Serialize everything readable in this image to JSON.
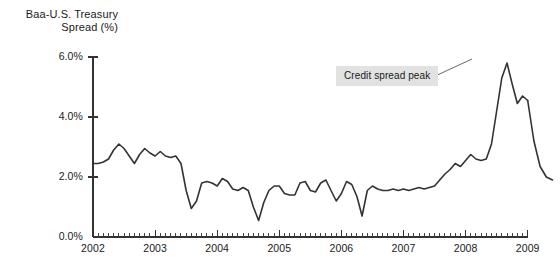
{
  "figure": {
    "title_line1": "Baa-U.S. Treasury",
    "title_line2": "Spread (%)",
    "line_color": "#333333",
    "axis_color": "#333333",
    "annotation_bg": "#e2e2e2"
  },
  "annotation": {
    "label": "Credit spread peak",
    "box_x": 336,
    "box_y": 66,
    "leader_from_x": 433,
    "leader_from_y": 77,
    "leader_to_x": 472,
    "leader_to_y": 59
  },
  "chart_data": {
    "type": "line",
    "xlabel": "",
    "ylabel": "Baa-U.S. Treasury Spread (%)",
    "xlim": [
      2002.0,
      2009.0
    ],
    "ylim": [
      0.0,
      6.0
    ],
    "grid": false,
    "legend": "none",
    "y_ticks": [
      0.0,
      2.0,
      4.0,
      6.0
    ],
    "y_tick_labels": [
      "0.0%",
      "2.0%",
      "4.0%",
      "6.0%"
    ],
    "x_ticks": [
      2002,
      2003,
      2004,
      2005,
      2006,
      2007,
      2008,
      2009
    ],
    "x_tick_labels": [
      "2002",
      "2003",
      "2004",
      "2005",
      "2006",
      "2007",
      "2008",
      "2009"
    ],
    "x_minor_tick_interval": 0.0833,
    "series": [
      {
        "name": "Baa-U.S. Treasury Spread",
        "x": [
          2002.0,
          2002.083,
          2002.167,
          2002.25,
          2002.333,
          2002.417,
          2002.5,
          2002.583,
          2002.667,
          2002.75,
          2002.833,
          2002.917,
          2003.0,
          2003.083,
          2003.167,
          2003.25,
          2003.333,
          2003.417,
          2003.5,
          2003.583,
          2003.667,
          2003.75,
          2003.833,
          2003.917,
          2004.0,
          2004.083,
          2004.167,
          2004.25,
          2004.333,
          2004.417,
          2004.5,
          2004.583,
          2004.667,
          2004.75,
          2004.833,
          2004.917,
          2005.0,
          2005.083,
          2005.167,
          2005.25,
          2005.333,
          2005.417,
          2005.5,
          2005.583,
          2005.667,
          2005.75,
          2005.833,
          2005.917,
          2006.0,
          2006.083,
          2006.167,
          2006.25,
          2006.333,
          2006.417,
          2006.5,
          2006.583,
          2006.667,
          2006.75,
          2006.833,
          2006.917,
          2007.0,
          2007.083,
          2007.167,
          2007.25,
          2007.333,
          2007.417,
          2007.5,
          2007.583,
          2007.667,
          2007.75,
          2007.833,
          2007.917,
          2008.0,
          2008.083,
          2008.167,
          2008.25,
          2008.333,
          2008.417,
          2008.5,
          2008.583,
          2008.667,
          2008.75,
          2008.833,
          2008.917,
          2009.0
        ],
        "y": [
          2.45,
          2.45,
          2.5,
          2.6,
          2.9,
          3.1,
          2.95,
          2.7,
          2.45,
          2.75,
          2.95,
          2.8,
          2.7,
          2.85,
          2.7,
          2.65,
          2.7,
          2.45,
          1.55,
          0.95,
          1.2,
          1.8,
          1.85,
          1.8,
          1.7,
          1.95,
          1.85,
          1.6,
          1.55,
          1.65,
          1.55,
          1.0,
          0.55,
          1.15,
          1.55,
          1.7,
          1.7,
          1.45,
          1.4,
          1.4,
          1.8,
          1.85,
          1.55,
          1.5,
          1.8,
          1.9,
          1.55,
          1.2,
          1.45,
          1.85,
          1.75,
          1.35,
          0.7,
          1.55,
          1.7,
          1.6,
          1.55,
          1.55,
          1.6,
          1.55,
          1.6,
          1.55,
          1.6,
          1.65,
          1.6,
          1.65,
          1.7,
          1.9,
          2.1,
          2.25,
          2.45,
          2.35,
          2.55,
          2.75,
          2.6,
          2.55,
          2.6,
          3.1,
          4.2,
          5.3,
          5.8,
          5.1,
          4.45,
          4.7,
          4.55
        ]
      },
      {
        "name": "tail_segment",
        "x": [
          2009.0,
          2009.1,
          2009.2,
          2009.3,
          2009.4
        ],
        "y": [
          4.55,
          3.2,
          2.35,
          2.0,
          1.9
        ]
      }
    ],
    "annotations": [
      {
        "text": "Credit spread peak",
        "points_to_x": 2008.6,
        "points_to_y": 5.9
      }
    ]
  }
}
